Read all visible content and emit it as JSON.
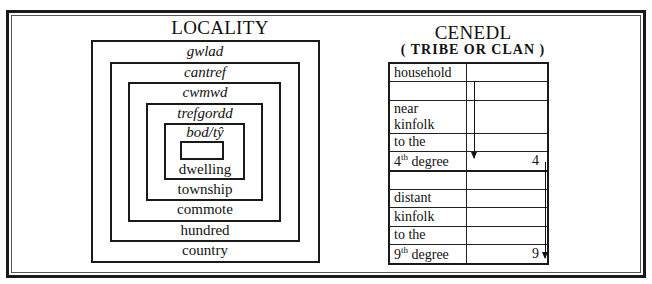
{
  "locality": {
    "title": "LOCALITY",
    "levels": [
      {
        "welsh": "gwlad",
        "english": "country"
      },
      {
        "welsh": "cantref",
        "english": "hundred"
      },
      {
        "welsh": "cwmwd",
        "english": "commote"
      },
      {
        "welsh": "trefgordd",
        "english": "township"
      },
      {
        "welsh": "bod/tŷ",
        "english": "dwelling"
      }
    ]
  },
  "cenedl": {
    "title": "CENEDL",
    "subtitle": "( TRIBE OR CLAN )",
    "rows": [
      {
        "label": "household",
        "value": ""
      },
      {
        "label": "",
        "value": ""
      },
      {
        "label": "near kinfolk",
        "value": ""
      },
      {
        "label": "to the",
        "value": ""
      },
      {
        "label_num": "4",
        "label_sup": "th",
        "label_rest": " degree",
        "value": "4"
      },
      {
        "label": "",
        "value": ""
      },
      {
        "label": "distant",
        "value": ""
      },
      {
        "label": "kinfolk",
        "value": ""
      },
      {
        "label": "to the",
        "value": ""
      },
      {
        "label_num": "9",
        "label_sup": "th",
        "label_rest": " degree",
        "value": "9"
      }
    ]
  }
}
